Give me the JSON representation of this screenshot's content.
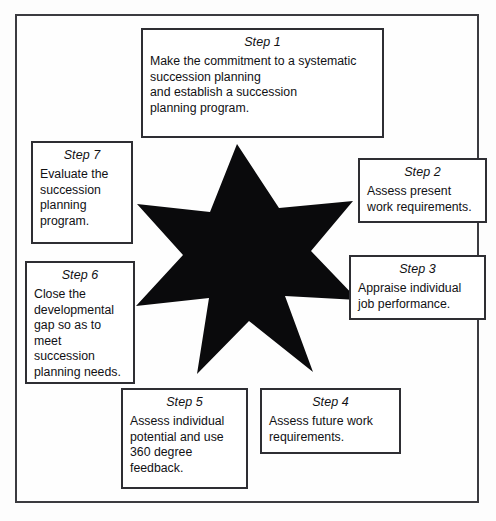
{
  "diagram": {
    "shape": {
      "name": "seven-pointed-star",
      "fill_color": "#0a0a0c",
      "points": 7
    },
    "frame": {
      "border_color": "#3b3b40",
      "background_color": "#fefefe"
    },
    "steps": [
      {
        "id": "step1",
        "title": "Step 1",
        "body": "Make the commitment to a systematic\nsuccession planning\nand establish a succession\nplanning program."
      },
      {
        "id": "step2",
        "title": "Step 2",
        "body": "Assess present\nwork requirements."
      },
      {
        "id": "step3",
        "title": "Step 3",
        "body": "Appraise individual\njob performance."
      },
      {
        "id": "step4",
        "title": "Step 4",
        "body": "Assess future work\nrequirements."
      },
      {
        "id": "step5",
        "title": "Step 5",
        "body": "Assess individual\npotential and use\n360 degree\nfeedback."
      },
      {
        "id": "step6",
        "title": "Step 6",
        "body": "Close the\ndevelopmental\ngap so as to\nmeet\nsuccession\nplanning needs."
      },
      {
        "id": "step7",
        "title": "Step 7",
        "body": "Evaluate the\nsuccession\nplanning\nprogram."
      }
    ]
  }
}
